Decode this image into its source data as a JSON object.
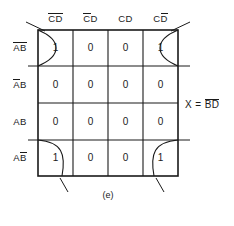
{
  "figure": {
    "caption": "(e)",
    "type": "karnaugh-map",
    "equation": {
      "lhs": "X",
      "eq": "=",
      "terms": [
        {
          "letter": "B",
          "bar": true
        },
        {
          "letter": "D",
          "bar": true
        }
      ],
      "plain": "X = B̅D̅"
    }
  },
  "kmap": {
    "column_headers": [
      {
        "parts": [
          {
            "letter": "C",
            "bar": true
          },
          {
            "letter": "D",
            "bar": true
          }
        ],
        "plain": "C̅D̅"
      },
      {
        "parts": [
          {
            "letter": "C",
            "bar": true
          },
          {
            "letter": "D",
            "bar": false
          }
        ],
        "plain": "C̅D"
      },
      {
        "parts": [
          {
            "letter": "C",
            "bar": false
          },
          {
            "letter": "D",
            "bar": false
          }
        ],
        "plain": "CD"
      },
      {
        "parts": [
          {
            "letter": "C",
            "bar": false
          },
          {
            "letter": "D",
            "bar": true
          }
        ],
        "plain": "CD̅"
      }
    ],
    "row_headers": [
      {
        "parts": [
          {
            "letter": "A",
            "bar": true
          },
          {
            "letter": "B",
            "bar": true
          }
        ],
        "plain": "A̅B̅"
      },
      {
        "parts": [
          {
            "letter": "A",
            "bar": true
          },
          {
            "letter": "B",
            "bar": false
          }
        ],
        "plain": "A̅B"
      },
      {
        "parts": [
          {
            "letter": "A",
            "bar": false
          },
          {
            "letter": "B",
            "bar": false
          }
        ],
        "plain": "AB"
      },
      {
        "parts": [
          {
            "letter": "A",
            "bar": false
          },
          {
            "letter": "B",
            "bar": true
          }
        ],
        "plain": "AB̅"
      }
    ],
    "cells": [
      [
        "1",
        "0",
        "0",
        "1"
      ],
      [
        "0",
        "0",
        "0",
        "0"
      ],
      [
        "0",
        "0",
        "0",
        "0"
      ],
      [
        "1",
        "0",
        "0",
        "1"
      ]
    ],
    "groups": [
      {
        "name": "corner-wrap-group",
        "cells": [
          "r0c0",
          "r0c3",
          "r3c0",
          "r3c3"
        ],
        "style": "wrap-around-loop"
      }
    ],
    "colors": {
      "line": "#1a1a1a",
      "text": "#1a1a1a",
      "background": "#ffffff"
    }
  }
}
